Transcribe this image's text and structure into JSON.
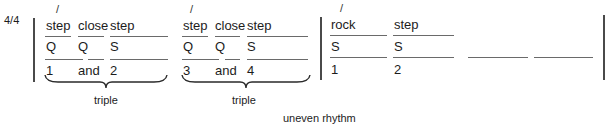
{
  "time_signature": "4/4",
  "measures": [
    {
      "steps": [
        {
          "label": "step",
          "accent": "/",
          "beat_type": "Q",
          "count": "1"
        },
        {
          "label": "close",
          "accent": "",
          "beat_type": "Q",
          "count": "and"
        },
        {
          "label": "step",
          "accent": "",
          "beat_type": "S",
          "count": "2"
        }
      ],
      "group_label": "triple"
    },
    {
      "steps": [
        {
          "label": "step",
          "accent": "/",
          "beat_type": "Q",
          "count": "3"
        },
        {
          "label": "close",
          "accent": "",
          "beat_type": "Q",
          "count": "and"
        },
        {
          "label": "step",
          "accent": "",
          "beat_type": "S",
          "count": "4"
        }
      ],
      "group_label": "triple"
    },
    {
      "steps": [
        {
          "label": "rock",
          "accent": "/",
          "beat_type": "S",
          "count": "1"
        },
        {
          "label": "step",
          "accent": "",
          "beat_type": "S",
          "count": "2"
        }
      ],
      "group_label": ""
    }
  ],
  "caption": "uneven rhythm",
  "colors": {
    "text": "#1c1c1c",
    "lines": "#6a6a6a"
  }
}
